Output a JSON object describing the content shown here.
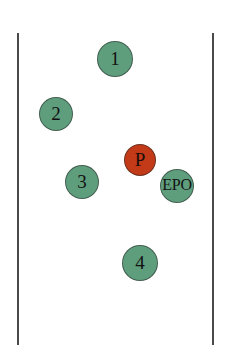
{
  "diagram": {
    "background_color": "#ffffff",
    "line_color": "#4a4a4a",
    "green_color": "#5f9e7d",
    "red_color": "#c23a18",
    "boundaries": [
      {
        "name": "left-boundary-line",
        "x": 17,
        "y_top": 33,
        "y_bottom": 345
      },
      {
        "name": "right-boundary-line",
        "x": 212,
        "y_top": 33,
        "y_bottom": 345
      }
    ],
    "nodes": [
      {
        "id": "node-1",
        "label": "1",
        "color": "green",
        "cx": 115,
        "cy": 59,
        "r": 18
      },
      {
        "id": "node-2",
        "label": "2",
        "color": "green",
        "cx": 56,
        "cy": 114,
        "r": 17
      },
      {
        "id": "node-p",
        "label": "P",
        "color": "red",
        "cx": 140,
        "cy": 160,
        "r": 16
      },
      {
        "id": "node-3",
        "label": "3",
        "color": "green",
        "cx": 82,
        "cy": 182,
        "r": 17
      },
      {
        "id": "node-epo",
        "label": "EPO",
        "color": "green",
        "cx": 177,
        "cy": 186,
        "r": 17
      },
      {
        "id": "node-4",
        "label": "4",
        "color": "green",
        "cx": 140,
        "cy": 263,
        "r": 18
      }
    ]
  }
}
